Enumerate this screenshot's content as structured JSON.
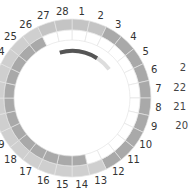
{
  "cycle_wheel": {
    "total_days": 28,
    "day_labels": [
      "1",
      "2",
      "3",
      "4",
      "5",
      "6",
      "7",
      "8",
      "9",
      "10",
      "11",
      "12",
      "13",
      "14",
      "15",
      "16",
      "17",
      "18",
      "19",
      "20",
      "21",
      "22",
      "23",
      "24",
      "25",
      "26",
      "27",
      "28"
    ],
    "outer_ring_state": [
      "medium",
      "medium",
      "dark",
      "dark",
      "dark",
      "dark",
      "dark",
      "dark",
      "dark",
      "dark",
      "dark",
      "dark",
      "light",
      "light",
      "light",
      "light",
      "light",
      "light",
      "light",
      "light",
      "light",
      "light",
      "light",
      "light",
      "light",
      "light",
      "medium",
      "medium"
    ],
    "inner_ring_state": [
      "white",
      "white",
      "white",
      "white",
      "white",
      "white",
      "white",
      "white",
      "white",
      "white",
      "white",
      "white",
      "white",
      "dark",
      "dark",
      "dark",
      "dark",
      "dark",
      "dark",
      "dark",
      "dark",
      "dark",
      "dark",
      "dark",
      "dark",
      "dark",
      "white",
      "white"
    ],
    "progress_arc": {
      "start_day": 28,
      "end_day": 3
    }
  },
  "side_wheel": {
    "labels": [
      "2",
      "22",
      "21",
      "20"
    ]
  },
  "colors": {
    "light": "#cfcfcf",
    "medium": "#c4c4c4",
    "dark": "#a9a9a9",
    "white": "#ffffff",
    "divider": "#e4e4e4",
    "arc_dark": "#555555",
    "arc_light": "#dddddd"
  }
}
